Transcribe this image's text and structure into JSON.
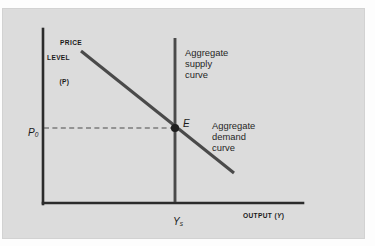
{
  "figure": {
    "type": "as-ad-equilibrium-diagram",
    "panel_background": "#dcdcdc",
    "page_background": "#ffffff",
    "ink_color": "#333333"
  },
  "axes": {
    "y_title_line1": "PRICE",
    "y_title_line2": "LEVEL",
    "y_title_line3": "(P)",
    "x_title_text": "OUTPUT (",
    "x_title_var": "Y",
    "x_title_close": ")"
  },
  "labels": {
    "aggregate_supply": "Aggregate\nsupply\ncurve",
    "aggregate_demand": "Aggregate\ndemand\ncurve",
    "equilibrium_point": "E",
    "price_level_value": "P",
    "price_level_sub": "0",
    "output_value": "Y",
    "output_sub": "s"
  },
  "chart_data": {
    "type": "line",
    "title": "",
    "xlabel": "OUTPUT (Y)",
    "ylabel": "PRICE LEVEL (P)",
    "xlim": [
      0,
      100
    ],
    "ylim": [
      0,
      100
    ],
    "grid": false,
    "legend": "none",
    "series": [
      {
        "name": "Aggregate demand curve",
        "kind": "downward-sloping-line",
        "points": [
          [
            23,
            92
          ],
          [
            88,
            25
          ]
        ]
      },
      {
        "name": "Aggregate supply curve",
        "kind": "vertical-line",
        "points": [
          [
            62,
            100
          ],
          [
            62,
            0
          ]
        ]
      },
      {
        "name": "Equilibrium reference line",
        "kind": "dashed-horizontal",
        "points": [
          [
            0,
            55
          ],
          [
            62,
            55
          ]
        ]
      }
    ],
    "annotations": [
      {
        "label": "E",
        "x": 62,
        "y": 55,
        "marker": "filled-circle"
      },
      {
        "label": "P0",
        "x": 0,
        "y": 55,
        "axis": "y-tick"
      },
      {
        "label": "Ys",
        "x": 62,
        "y": 0,
        "axis": "x-tick"
      }
    ]
  }
}
